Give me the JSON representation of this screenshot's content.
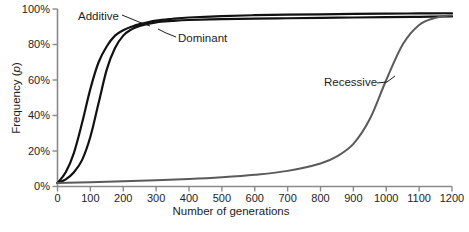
{
  "figure": {
    "background": "#ffffff",
    "axis_color": "#808080",
    "text_color": "#1d1d1d"
  },
  "axes": {
    "y_title_prefix": "Frequency (",
    "y_title_italic": "p",
    "y_title_suffix": ")",
    "x_title": "Number of generations",
    "y_ticks": [
      "0%",
      "20%",
      "40%",
      "60%",
      "80%",
      "100%"
    ],
    "x_ticks": [
      "0",
      "100",
      "200",
      "300",
      "400",
      "500",
      "600",
      "700",
      "800",
      "900",
      "1000",
      "1100",
      "1200"
    ]
  },
  "labels": {
    "additive": "Additive",
    "dominant": "Dominant",
    "recessive": "Recessive"
  },
  "chart_data": {
    "type": "line",
    "title": "",
    "xlabel": "Number of generations",
    "ylabel": "Frequency (p)",
    "xlim": [
      0,
      1200
    ],
    "ylim": [
      0,
      100
    ],
    "grid": false,
    "legend": "inline-annotations",
    "x_ticks": [
      0,
      100,
      200,
      300,
      400,
      500,
      600,
      700,
      800,
      900,
      1000,
      1100,
      1200
    ],
    "y_ticks": [
      0,
      20,
      40,
      60,
      80,
      100
    ],
    "y_tick_labels": [
      "0%",
      "20%",
      "40%",
      "60%",
      "80%",
      "100%"
    ],
    "series": [
      {
        "name": "Additive",
        "color": "#111111",
        "width": 2.2,
        "x": [
          0,
          25,
          50,
          75,
          100,
          125,
          150,
          175,
          200,
          225,
          250,
          300,
          350,
          400,
          500,
          600,
          700,
          800,
          900,
          1000,
          1100,
          1200
        ],
        "values": [
          2,
          8,
          19,
          36,
          55,
          70,
          79,
          85,
          88,
          90,
          91.5,
          93.5,
          94.5,
          95.2,
          96,
          96.5,
          96.8,
          97,
          97.2,
          97.4,
          97.5,
          97.6
        ]
      },
      {
        "name": "Dominant",
        "color": "#111111",
        "width": 2.2,
        "x": [
          0,
          25,
          50,
          75,
          100,
          125,
          150,
          175,
          200,
          225,
          250,
          300,
          350,
          400,
          500,
          600,
          700,
          800,
          900,
          1000,
          1100,
          1200
        ],
        "values": [
          2,
          4,
          8,
          15,
          28,
          47,
          66,
          78,
          85,
          88.5,
          90.5,
          92.5,
          93.3,
          93.8,
          94.3,
          94.6,
          94.8,
          95,
          95.2,
          95.4,
          95.6,
          95.8
        ]
      },
      {
        "name": "Recessive",
        "color": "#5a5a5a",
        "width": 2.0,
        "x": [
          0,
          100,
          200,
          300,
          400,
          500,
          600,
          700,
          800,
          850,
          900,
          950,
          1000,
          1050,
          1100,
          1150,
          1200
        ],
        "values": [
          2,
          2.4,
          2.9,
          3.5,
          4.2,
          5.2,
          6.6,
          8.8,
          13,
          17,
          24,
          38,
          60,
          80,
          91,
          95,
          96.5
        ]
      }
    ],
    "annotations": [
      {
        "text": "Additive",
        "x_px": 78,
        "y_px": 10,
        "leader_to": [
          0,
          0
        ]
      },
      {
        "text": "Dominant",
        "x_px": 178,
        "y_px": 32,
        "leader_to": [
          0,
          0
        ]
      },
      {
        "text": "Recessive",
        "x_px": 324,
        "y_px": 76,
        "leader_to": [
          0,
          0
        ]
      }
    ]
  }
}
